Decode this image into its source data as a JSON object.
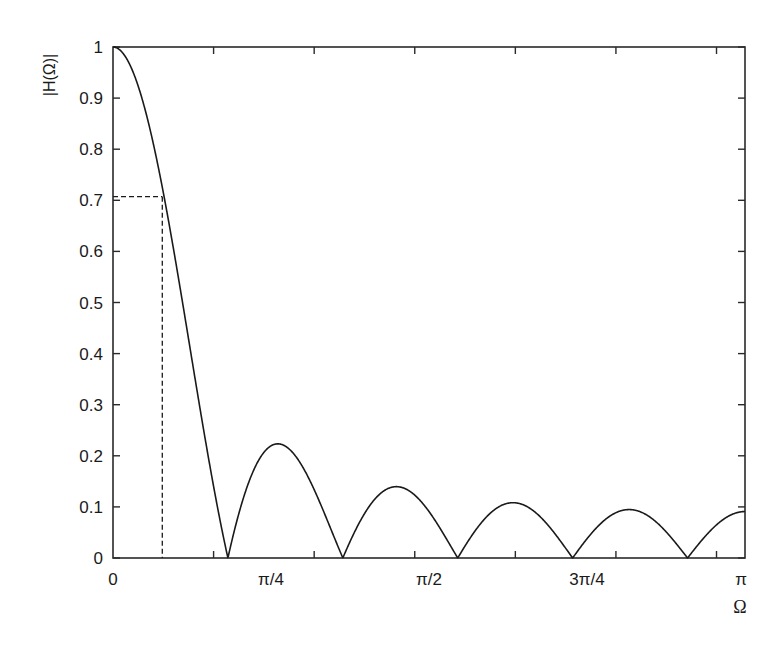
{
  "chart_data": {
    "type": "line",
    "title": "",
    "xlabel": "Ω",
    "ylabel": "|H(Ω)|",
    "xlim": [
      0,
      3.14159265
    ],
    "ylim": [
      0,
      1
    ],
    "grid": false,
    "legend": null,
    "filter": {
      "description": "Magnitude response of an 11-point moving-average filter",
      "formula": "|sin(11Ω/2) / (11·sin(Ω/2))|",
      "N": 11
    },
    "x_tick_labels": [
      {
        "value": 0,
        "label": "0"
      },
      {
        "value": 0.785398,
        "label": "π/4"
      },
      {
        "value": 1.570796,
        "label": "π/2"
      },
      {
        "value": 2.356194,
        "label": "3π/4"
      },
      {
        "value": 3.141593,
        "label": "π"
      }
    ],
    "x_minor_ticks": [
      0.5,
      1.0,
      1.5,
      2.0,
      2.5,
      3.0
    ],
    "y_ticks": [
      {
        "value": 0,
        "label": "0"
      },
      {
        "value": 0.1,
        "label": "0.1"
      },
      {
        "value": 0.2,
        "label": "0.2"
      },
      {
        "value": 0.3,
        "label": "0.3"
      },
      {
        "value": 0.4,
        "label": "0.4"
      },
      {
        "value": 0.5,
        "label": "0.5"
      },
      {
        "value": 0.6,
        "label": "0.6"
      },
      {
        "value": 0.7,
        "label": "0.7"
      },
      {
        "value": 0.8,
        "label": "0.8"
      },
      {
        "value": 0.9,
        "label": "0.9"
      },
      {
        "value": 1,
        "label": "1"
      }
    ],
    "key_points": {
      "dc_gain": 1.0,
      "cutoff_3db": {
        "omega": 0.25,
        "magnitude": 0.707
      },
      "nulls": [
        0.571,
        1.142,
        1.714,
        2.285,
        2.856
      ],
      "sidelobe_peaks": [
        {
          "omega": 0.81,
          "magnitude": 0.22
        },
        {
          "omega": 1.39,
          "magnitude": 0.135
        },
        {
          "omega": 1.96,
          "magnitude": 0.1
        },
        {
          "omega": 2.53,
          "magnitude": 0.085
        },
        {
          "omega": 3.14159,
          "magnitude": 0.0909
        }
      ]
    },
    "annotations": [
      {
        "type": "dashed-horizontal",
        "y": 0.707,
        "x_from": 0,
        "x_to": 0.25
      },
      {
        "type": "dashed-vertical",
        "x": 0.25,
        "y_from": 0,
        "y_to": 0.707
      }
    ],
    "colors": {
      "line": "#1a1a1a",
      "axes": "#2a2a2a",
      "background": "#ffffff"
    }
  }
}
